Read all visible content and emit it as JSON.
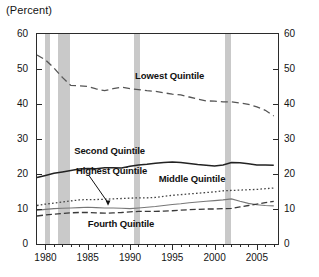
{
  "chart_data": {
    "type": "line",
    "title": "(Percent)",
    "xlabel": "",
    "ylabel": "",
    "xlim": [
      1979,
      2007.5
    ],
    "ylim": [
      0,
      60
    ],
    "yticks": [
      0,
      10,
      20,
      30,
      40,
      50,
      60
    ],
    "xticks": [
      1980,
      1985,
      1990,
      1995,
      2000,
      2005
    ],
    "xtick_minor_step": 1,
    "grid": false,
    "legend_position": "inline-annotations",
    "dual_y_axis": true,
    "shaded_regions": [
      {
        "label": "recession",
        "start": 1980.0,
        "end": 1980.55
      },
      {
        "label": "recession",
        "start": 1981.5,
        "end": 1982.9
      },
      {
        "label": "recession",
        "start": 1990.5,
        "end": 1991.2
      },
      {
        "label": "recession",
        "start": 2001.2,
        "end": 2001.9
      }
    ],
    "shaded_color": "#c9c9c9",
    "x": [
      1979,
      1980,
      1981,
      1982,
      1983,
      1984,
      1985,
      1986,
      1987,
      1988,
      1989,
      1990,
      1991,
      1992,
      1993,
      1994,
      1995,
      1996,
      1997,
      1998,
      1999,
      2000,
      2001,
      2002,
      2003,
      2004,
      2005,
      2006,
      2007
    ],
    "series": [
      {
        "name": "Lowest Quintile",
        "style": "dashed",
        "color": "#555555",
        "values": [
          54.0,
          52.6,
          50.3,
          47.6,
          45.3,
          45.2,
          45.0,
          44.3,
          43.8,
          44.4,
          44.8,
          44.4,
          44.1,
          43.8,
          43.6,
          43.2,
          42.8,
          42.6,
          42.0,
          41.4,
          40.9,
          40.8,
          40.6,
          40.6,
          40.3,
          39.9,
          39.2,
          38.2,
          36.6
        ],
        "label_x": 1990.6,
        "label_y": 48.0
      },
      {
        "name": "Second Quintile",
        "style": "solid",
        "color": "#222222",
        "values": [
          19.0,
          19.6,
          20.2,
          20.6,
          21.0,
          21.4,
          21.6,
          21.5,
          21.8,
          21.8,
          21.7,
          22.2,
          22.6,
          22.8,
          23.1,
          23.3,
          23.4,
          23.3,
          23.0,
          22.7,
          22.5,
          22.3,
          22.6,
          23.3,
          23.2,
          22.9,
          22.6,
          22.6,
          22.5
        ],
        "label_x": 1983.4,
        "label_y": 26.5
      },
      {
        "name": "Middle Quintile",
        "style": "dotted",
        "color": "#444444",
        "values": [
          11.0,
          11.4,
          11.7,
          12.0,
          12.3,
          12.6,
          12.7,
          12.7,
          12.8,
          12.9,
          13.0,
          13.1,
          13.2,
          13.2,
          13.3,
          13.6,
          13.9,
          14.1,
          14.3,
          14.5,
          14.7,
          14.9,
          15.2,
          15.3,
          15.4,
          15.5,
          15.6,
          15.8,
          16.0
        ],
        "label_x": 1993.4,
        "label_y": 18.5
      },
      {
        "name": "Highest Quintile",
        "style": "thin-solid",
        "color": "#777777",
        "values": [
          9.6,
          9.9,
          10.1,
          10.2,
          10.3,
          10.4,
          10.5,
          10.4,
          10.3,
          10.3,
          10.2,
          10.1,
          10.3,
          10.5,
          10.7,
          11.0,
          11.3,
          11.5,
          11.8,
          12.0,
          12.2,
          12.4,
          12.6,
          12.9,
          12.2,
          11.6,
          11.2,
          11.0,
          10.9
        ],
        "label_x": 1983.6,
        "label_y": 20.8,
        "has_arrow": true,
        "arrow_to_x": 1987.4,
        "arrow_to_y": 11.2
      },
      {
        "name": "Fourth Quintile",
        "style": "dash-dot",
        "color": "#3a3a3a",
        "values": [
          8.0,
          8.3,
          8.5,
          8.7,
          8.9,
          9.0,
          9.0,
          8.9,
          8.8,
          8.9,
          9.0,
          9.2,
          9.3,
          9.3,
          9.3,
          9.4,
          9.5,
          9.7,
          9.8,
          9.9,
          10.0,
          10.0,
          10.1,
          10.2,
          10.6,
          11.0,
          11.4,
          11.8,
          12.2
        ],
        "label_x": 1985.0,
        "label_y": 5.6
      }
    ]
  }
}
